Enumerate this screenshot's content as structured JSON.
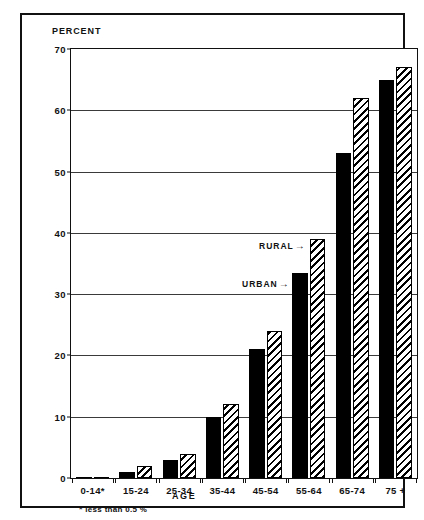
{
  "figure": {
    "y_axis_title": "PERCENT",
    "x_axis_title": "AGE",
    "footnote_marker": "*",
    "footnote_text": "less than 0.5 %",
    "annotations": {
      "rural_label": "RURAL",
      "urban_label": "URBAN",
      "arrow": "→"
    },
    "colors": {
      "urban_fill": "#000000",
      "rural_fill": "#ffffff",
      "rural_hatch": "#000000",
      "ink": "#111111",
      "background": "#ffffff"
    }
  },
  "chart_data": {
    "type": "bar",
    "title": "",
    "xlabel": "AGE",
    "ylabel": "PERCENT",
    "ylim": [
      0,
      70
    ],
    "yticks": [
      0,
      10,
      20,
      30,
      40,
      50,
      60,
      70
    ],
    "ytick_labels": [
      "0",
      "10",
      "20",
      "30",
      "40",
      "50",
      "60",
      "70"
    ],
    "grid": true,
    "grid_axis": "y",
    "legend_position": "inline-annotation",
    "categories": [
      "0-14*",
      "15-24",
      "25-34",
      "35-44",
      "45-54",
      "55-64",
      "65-74",
      "75 +"
    ],
    "series": [
      {
        "name": "URBAN",
        "fill": "solid-black",
        "values": [
          0.2,
          1,
          3,
          10,
          21,
          33.5,
          53,
          65
        ]
      },
      {
        "name": "RURAL",
        "fill": "diagonal-hatch",
        "values": [
          0.2,
          2,
          4,
          12,
          24,
          39,
          62,
          67
        ]
      }
    ]
  }
}
